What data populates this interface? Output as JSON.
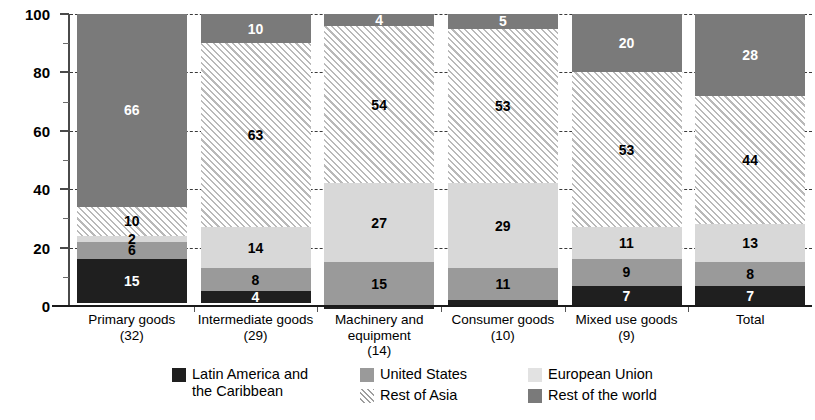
{
  "chart_data": {
    "type": "bar",
    "subtype": "stacked-100-percent",
    "title": "",
    "xlabel": "",
    "ylabel": "",
    "ylim": [
      0,
      100
    ],
    "yticks": [
      0,
      20,
      40,
      60,
      80,
      100
    ],
    "ytick_labels": [
      "0",
      "20",
      "40",
      "60",
      "80",
      "100"
    ],
    "minor_yticks": [
      10,
      30,
      50,
      70,
      90
    ],
    "grid": "horizontal-dashed",
    "legend_position": "bottom",
    "categories": [
      "Primary goods",
      "Intermediate goods",
      "Machinery and equipment",
      "Consumer goods",
      "Mixed use goods",
      "Total"
    ],
    "category_sublabels": [
      "(32)",
      "(29)",
      "(14)",
      "(10)",
      "(9)",
      ""
    ],
    "series": [
      {
        "name": "Latin America and the Caribbean",
        "color": "#1f1f1f",
        "pattern": "solid",
        "values": [
          15,
          4,
          1,
          2,
          7,
          7
        ],
        "labels": [
          "15",
          "4",
          "",
          "",
          "7",
          "7"
        ]
      },
      {
        "name": "United States",
        "color": "#9a9a9a",
        "pattern": "solid",
        "values": [
          6,
          8,
          15,
          11,
          9,
          8
        ],
        "labels": [
          "6",
          "8",
          "15",
          "11",
          "9",
          "8"
        ]
      },
      {
        "name": "European Union",
        "color": "#d8d8d8",
        "pattern": "solid",
        "values": [
          2,
          14,
          27,
          29,
          11,
          13
        ],
        "labels": [
          "2",
          "14",
          "27",
          "29",
          "11",
          "13"
        ]
      },
      {
        "name": "Rest of Asia",
        "color": "#f2f2f2",
        "pattern": "diagonal-hatch",
        "values": [
          10,
          63,
          54,
          53,
          53,
          44
        ],
        "labels": [
          "10",
          "63",
          "54",
          "53",
          "53",
          "44"
        ]
      },
      {
        "name": "Rest of the world",
        "color": "#7a7a7a",
        "pattern": "solid",
        "values": [
          66,
          10,
          4,
          5,
          20,
          28
        ],
        "labels": [
          "66",
          "10",
          "4",
          "5",
          "20",
          "28"
        ]
      }
    ]
  },
  "legend": {
    "entries": [
      {
        "label": "Latin America and\nthe Caribbean",
        "swatch": "lac-swatch"
      },
      {
        "label": "United States",
        "swatch": "us-swatch"
      },
      {
        "label": "Rest of Asia",
        "swatch": "asia-swatch"
      },
      {
        "label": "European Union",
        "swatch": "eu-swatch"
      },
      {
        "label": "Rest of the world",
        "swatch": "row-swatch"
      }
    ]
  }
}
